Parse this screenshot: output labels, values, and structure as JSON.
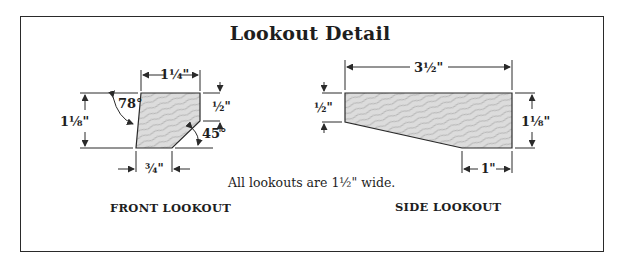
{
  "title": "Lookout Detail",
  "note": "All lookouts are 1½\" wide.",
  "front": {
    "caption": "FRONT LOOKOUT",
    "dim_top": "1¼\"",
    "dim_left": "1⅛\"",
    "dim_right": "½\"",
    "dim_bottom": "¾\"",
    "angle_left": "78°",
    "angle_right": "45°"
  },
  "side": {
    "caption": "SIDE LOOKOUT",
    "dim_top": "3½\"",
    "dim_left": "½\"",
    "dim_right": "1⅛\"",
    "dim_bottom": "1\""
  },
  "colors": {
    "line": "#2a2a2a",
    "wood_fill": "#d9d9d9",
    "grain": "#a8a8a8"
  }
}
